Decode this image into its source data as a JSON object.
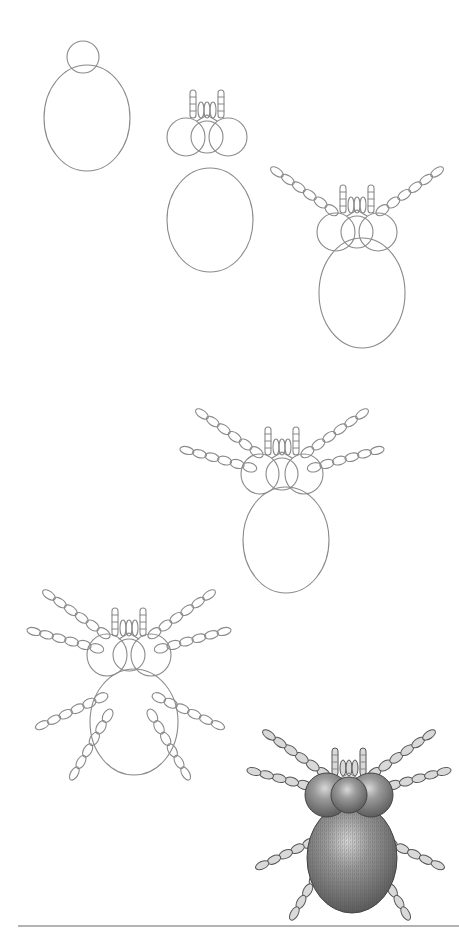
{
  "page": {
    "background": "#ffffff",
    "line_color": "#8a8a8a",
    "shade_color": "#6e6e6e",
    "bottom_rule": {
      "x1": 18,
      "x2": 459,
      "y": 926
    }
  },
  "steps": [
    {
      "n": 1,
      "label": "Step 1",
      "head": {
        "cx": 83,
        "cy": 57,
        "r": 16
      },
      "body": {
        "cx": 87,
        "cy": 118,
        "rx": 43,
        "ry": 53
      },
      "eyes": false,
      "legs": 0
    },
    {
      "n": 2,
      "label": "Step 2",
      "head": {
        "cx": 207,
        "cy": 137,
        "r": 16
      },
      "lobes": {
        "dx": 21,
        "rx": 19,
        "ry": 19
      },
      "body": {
        "cx": 210,
        "cy": 220,
        "rx": 43,
        "ry": 52
      },
      "fangs": true,
      "legs": 0
    },
    {
      "n": 3,
      "label": "Step 3",
      "head": {
        "cx": 357,
        "cy": 232,
        "r": 16
      },
      "lobes": {
        "dx": 21,
        "rx": 19,
        "ry": 19
      },
      "body": {
        "cx": 362,
        "cy": 293,
        "rx": 43,
        "ry": 55
      },
      "fangs": true,
      "legs": 2
    },
    {
      "n": 4,
      "label": "Step 4",
      "head": {
        "cx": 282,
        "cy": 474,
        "r": 16
      },
      "lobes": {
        "dx": 22,
        "rx": 19,
        "ry": 20
      },
      "body": {
        "cx": 286,
        "cy": 540,
        "rx": 43,
        "ry": 53
      },
      "fangs": true,
      "legs": 4
    },
    {
      "n": 5,
      "label": "Step 5",
      "head": {
        "cx": 129,
        "cy": 655,
        "r": 16
      },
      "lobes": {
        "dx": 22,
        "rx": 20,
        "ry": 21
      },
      "body": {
        "cx": 134,
        "cy": 722,
        "rx": 44,
        "ry": 53
      },
      "fangs": true,
      "legs": 8
    },
    {
      "n": 6,
      "label": "Step 6 (shaded)",
      "head": {
        "cx": 349,
        "cy": 795,
        "r": 18
      },
      "lobes": {
        "dx": 22,
        "rx": 22,
        "ry": 22
      },
      "body": {
        "cx": 352,
        "cy": 858,
        "rx": 45,
        "ry": 55
      },
      "fangs": true,
      "legs": 8,
      "shaded": true
    }
  ]
}
